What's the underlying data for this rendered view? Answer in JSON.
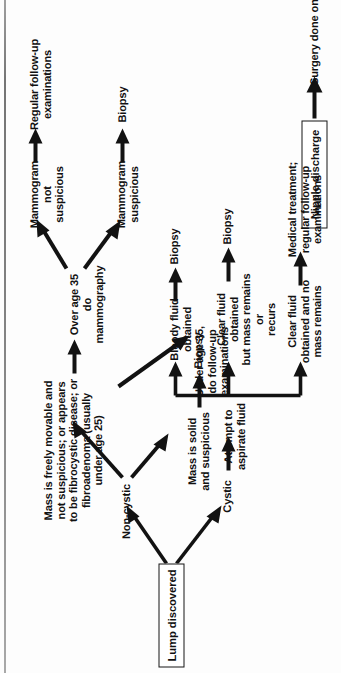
{
  "page": {
    "orientation": "rotated-90-ccw",
    "rule_color": "#6b6b6b",
    "ink_color": "#121212",
    "background": "#fdfdfd"
  },
  "boxes": {
    "lump_discovered": "Lump discovered",
    "nipple_discharge": "Nipple discharge"
  },
  "nodes": {
    "non_cystic": "Non-cystic",
    "cystic": "Cystic",
    "mass_solid": "Mass is solid\nand suspicious",
    "biopsy_solid": "Biopsy",
    "mass_movable": "Mass is freely movable and\nnot suspicious; or appears\nto be fibrocystic disease; or\nfibroadenoma (usually\nunder age 25)",
    "under_35": "Under age 35,\ndo follow-up\nexaminations",
    "over_35": "Over age 35\ndo mammography",
    "mammogram_not_suspicious": "Mammogram\nnot suspicious",
    "mammogram_suspicious": "Mammogram\nsuspicious",
    "regular_followup": "Regular follow-up\nexaminations",
    "biopsy_mammogram": "Biopsy",
    "aspirate": "Attempt to\naspirate fluid",
    "bloody_fluid": "Bloody fluid\nobtained",
    "biopsy_bloody": "Biopsy",
    "clear_fluid_remains": "Clear fluid obtained\nbut mass remains or\nrecurs",
    "biopsy_clear": "Biopsy",
    "clear_fluid_no_mass": "Clear fluid\nobtained and no\nmass remains",
    "medical_treatment": "Medical treatment;\nregular follow-up\nexaminations",
    "surgery_note": "Surgery done only if a lump can be"
  }
}
